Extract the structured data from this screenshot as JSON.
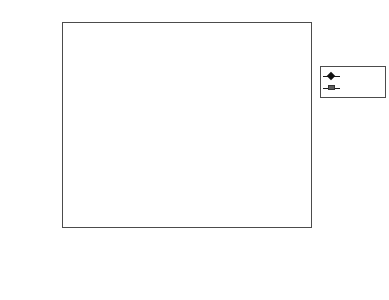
{
  "chart_data": {
    "type": "line",
    "xlabel": "",
    "ylabel": "",
    "log_scale_y": true,
    "ylim": [
      1,
      100000
    ],
    "grid": true,
    "legend_position": "right",
    "y_ticks": [
      {
        "value": 100000,
        "label": "$100,000"
      },
      {
        "value": 10000,
        "label": "$10,000"
      },
      {
        "value": 1000,
        "label": "$1,000"
      },
      {
        "value": 100,
        "label": "$100"
      },
      {
        "value": 10,
        "label": "$10"
      },
      {
        "value": 1,
        "label": "$1"
      }
    ],
    "categories": [
      "1977",
      "1978",
      "1979",
      "1980",
      "1981",
      "1982",
      "1983",
      "1984",
      "1985",
      "1986",
      "1987",
      "1988",
      "1989",
      "1990",
      "1991",
      "1992",
      "1993",
      "1994",
      "Aug. 1995"
    ],
    "x_tick_labels": [
      "1977",
      "1979",
      "1981",
      "1983",
      "1985",
      "1987",
      "1989",
      "1991",
      "1993",
      "1995",
      "Aug. 1995"
    ],
    "series": [
      {
        "name": "BH",
        "marker": "diamond",
        "color": "#111111",
        "values": [
          100,
          130,
          195,
          300,
          390,
          620,
          1250,
          1450,
          2700,
          3500,
          3900,
          4800,
          9000,
          6900,
          9800,
          14500,
          19500,
          21000,
          33000
        ]
      },
      {
        "name": "S&P 500",
        "marker": "square",
        "color": "#6b6b6b",
        "values": [
          100,
          88,
          96,
          112,
          128,
          122,
          140,
          150,
          152,
          178,
          200,
          192,
          225,
          255,
          275,
          330,
          360,
          400,
          540
        ]
      }
    ]
  },
  "legend": {
    "entries": [
      {
        "label": "BH"
      },
      {
        "label": "S&P 500"
      }
    ]
  }
}
